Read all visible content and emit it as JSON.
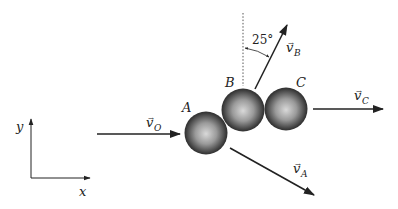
{
  "diagram": {
    "type": "collision-of-three-spheres",
    "axes": {
      "x_label": "x",
      "y_label": "y"
    },
    "balls": [
      {
        "id": "A",
        "label": "A"
      },
      {
        "id": "B",
        "label": "B"
      },
      {
        "id": "C",
        "label": "C"
      }
    ],
    "velocities": {
      "v_O": {
        "symbol": "v",
        "subscript": "O",
        "arrow_mark": "⃗"
      },
      "v_A": {
        "symbol": "v",
        "subscript": "A",
        "arrow_mark": "⃗"
      },
      "v_B": {
        "symbol": "v",
        "subscript": "B",
        "arrow_mark": "⃗"
      },
      "v_C": {
        "symbol": "v",
        "subscript": "C",
        "arrow_mark": "⃗"
      }
    },
    "angle": {
      "value": "25°",
      "reference": "vertical dashed line",
      "between": "vertical and v_B"
    },
    "colors": {
      "line": "#222222",
      "ball_dark": "#2a2a2a",
      "ball_light": "#d8d8d8",
      "background": "#ffffff"
    }
  }
}
